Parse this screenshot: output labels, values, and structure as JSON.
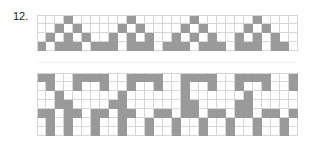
{
  "pattern_number": "12.",
  "colors": {
    "filled": "#9a9a9a",
    "grid_line": "#d6d6d6",
    "background": "#ffffff"
  },
  "top_chart": {
    "columns": 29,
    "rows": [
      "...#......#......#......#....",
      "..#.#....#.#....#.#....#.#...",
      ".#.#.#..#.#.#..#.#.#..#.#.#..",
      "#.###.###.###.###.###.###.##."
    ]
  },
  "bottom_chart": {
    "columns": 29,
    "rows": [
      "##..####..####..####..####..#",
      ".#..#..#..#..#..#..#..#..#..#",
      "..#......#......#......#.....",
      "..##....##......##....##.....",
      "##.##.##.##..##.##.##.##.##.#",
      ".#.#..#..#..#..#..#..#..#..#.",
      ".#.#..#..#..#..#..#..#..#..#."
    ]
  }
}
